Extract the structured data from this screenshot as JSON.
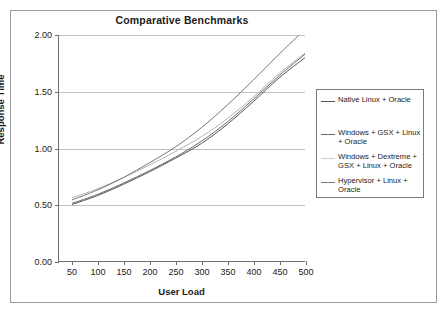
{
  "chart_data": {
    "type": "line",
    "title": "Comparative Benchmarks",
    "xlabel": "User Load",
    "ylabel": "Response Time",
    "x": [
      50,
      100,
      150,
      200,
      250,
      300,
      350,
      400,
      450,
      500
    ],
    "xlim": [
      25,
      500
    ],
    "ylim": [
      0.0,
      2.0
    ],
    "xticks": [
      "50",
      "100",
      "150",
      "200",
      "250",
      "300",
      "350",
      "400",
      "450",
      "500"
    ],
    "yticks": [
      "0.00",
      "0.50",
      "1.00",
      "1.50",
      "2.00"
    ],
    "ytick_values": [
      0.0,
      0.5,
      1.0,
      1.5,
      2.0
    ],
    "grid": "horizontal",
    "legend_position": "right",
    "series": [
      {
        "name": "Native Linux + Oracle",
        "color": "#555555",
        "values": [
          0.5,
          0.58,
          0.68,
          0.79,
          0.91,
          1.04,
          1.21,
          1.41,
          1.62,
          1.8
        ]
      },
      {
        "name": "Windows + GSX + Linux + Oracle",
        "color": "#6b6b6b",
        "values": [
          0.51,
          0.59,
          0.69,
          0.8,
          0.92,
          1.06,
          1.23,
          1.43,
          1.64,
          1.83
        ]
      },
      {
        "name": "Windows + Dextreme + GSX + Linux + Oracle",
        "color": "#b4b4b4",
        "values": [
          0.56,
          0.64,
          0.74,
          0.85,
          0.97,
          1.1,
          1.26,
          1.45,
          1.66,
          1.84
        ]
      },
      {
        "name": "Hypervisor + Linux + Oracle",
        "color": "#777777",
        "values": [
          0.54,
          0.63,
          0.74,
          0.87,
          1.01,
          1.18,
          1.38,
          1.6,
          1.83,
          2.05
        ]
      }
    ]
  },
  "legend": {
    "entries": [
      {
        "label": "Native Linux + Oracle",
        "color": "#555555",
        "show_swatch": true
      },
      {
        "label": "Windows + GSX + Linux + Oracle",
        "color": "#6b6b6b",
        "show_swatch": true
      },
      {
        "label": "Windows + Dextreme + GSX + Linux + Oracle",
        "color": "#cccccc",
        "show_swatch": true
      },
      {
        "label": "Hypervisor + Linux + Oracle",
        "color": "#777777",
        "show_swatch": true
      }
    ]
  },
  "style": {
    "frame_color": "#9a9a9a",
    "axis_color": "#6f6f6f",
    "grid_color": "#c2c2c2",
    "text_color": "#1b1b1b",
    "background": "#ffffff"
  }
}
